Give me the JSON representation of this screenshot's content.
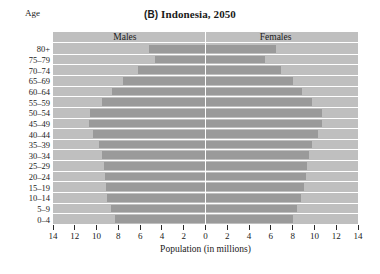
{
  "figure": {
    "panel_tag": "(B)",
    "title": "Indonesia, 2050",
    "age_caption": "Age",
    "background_color": "#bfbfbf",
    "bar_color": "#9a9a9a",
    "gridline_color": "#ffffff"
  },
  "labels": {
    "males": "Males",
    "females": "Females",
    "xaxis_title": "Population (in millions)"
  },
  "chart_data": {
    "type": "bar",
    "subtype": "population-pyramid",
    "title": "(B) Indonesia, 2050",
    "xlabel": "Population (in millions)",
    "ylabel": "Age",
    "xlim": [
      -14,
      14
    ],
    "xticks": [
      14,
      12,
      10,
      8,
      6,
      4,
      2,
      0,
      2,
      4,
      6,
      8,
      10,
      12,
      14
    ],
    "xtick_labels": [
      "14",
      "12",
      "10",
      "8",
      "6",
      "4",
      "2",
      "0",
      "2",
      "4",
      "6",
      "8",
      "10",
      "12",
      "14"
    ],
    "grid": true,
    "legend_position": "inside-top",
    "categories": [
      "80+",
      "75–79",
      "70–74",
      "65–69",
      "60–64",
      "55–59",
      "50–54",
      "45–49",
      "40–44",
      "35–39",
      "30–34",
      "25–29",
      "20–24",
      "15–19",
      "10–14",
      "5–9",
      "0–4"
    ],
    "series": [
      {
        "name": "Males",
        "side": "left",
        "values": [
          5.2,
          4.6,
          6.2,
          7.6,
          8.6,
          9.5,
          10.6,
          10.7,
          10.3,
          9.8,
          9.5,
          9.3,
          9.2,
          9.1,
          9.0,
          8.7,
          8.3
        ]
      },
      {
        "name": "Females",
        "side": "right",
        "values": [
          6.5,
          5.5,
          6.9,
          8.0,
          8.9,
          9.8,
          10.7,
          10.7,
          10.3,
          9.8,
          9.5,
          9.3,
          9.2,
          9.0,
          8.8,
          8.4,
          8.0
        ]
      }
    ]
  }
}
